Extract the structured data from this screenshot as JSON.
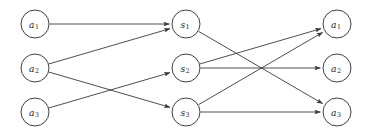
{
  "figure": {
    "background_color": "#ffffff",
    "width": 372,
    "height": 136
  },
  "style": {
    "node_fill": "#ffffff",
    "node_stroke": "#2b2b2b",
    "edge_color": "#3a3a3a",
    "label_color": "#1d1d1d",
    "node_radius": 14
  },
  "chart_data": {
    "type": "diagram",
    "subtype": "directed-tripartite-graph",
    "title": "",
    "columns": [
      {
        "name": "source-layer",
        "x": 35,
        "nodes": [
          {
            "id": "L1",
            "base": "a",
            "subscript": "1",
            "label": "a1",
            "x": 35,
            "y": 24
          },
          {
            "id": "L2",
            "base": "a",
            "subscript": "2",
            "label": "a2",
            "x": 35,
            "y": 68
          },
          {
            "id": "L3",
            "base": "a",
            "subscript": "3",
            "label": "a3",
            "x": 35,
            "y": 112
          }
        ]
      },
      {
        "name": "middle-layer",
        "x": 186,
        "nodes": [
          {
            "id": "M1",
            "base": "s",
            "subscript": "1",
            "label": "s1",
            "x": 186,
            "y": 24
          },
          {
            "id": "M2",
            "base": "s",
            "subscript": "2",
            "label": "s2",
            "x": 186,
            "y": 68
          },
          {
            "id": "M3",
            "base": "s",
            "subscript": "3",
            "label": "s3",
            "x": 186,
            "y": 112
          }
        ]
      },
      {
        "name": "target-layer",
        "x": 337,
        "nodes": [
          {
            "id": "R1",
            "base": "a",
            "subscript": "1",
            "label": "a1",
            "x": 337,
            "y": 24
          },
          {
            "id": "R2",
            "base": "a",
            "subscript": "2",
            "label": "a2",
            "x": 337,
            "y": 68
          },
          {
            "id": "R3",
            "base": "a",
            "subscript": "3",
            "label": "a3",
            "x": 337,
            "y": 112
          }
        ]
      }
    ],
    "edges": [
      {
        "id": "e1",
        "from": "L1",
        "to": "M1",
        "directed": true
      },
      {
        "id": "e2",
        "from": "L2",
        "to": "M1",
        "directed": true
      },
      {
        "id": "e3",
        "from": "L2",
        "to": "M3",
        "directed": true
      },
      {
        "id": "e4",
        "from": "L3",
        "to": "M2",
        "directed": true
      },
      {
        "id": "e5",
        "from": "M1",
        "to": "R3",
        "directed": true
      },
      {
        "id": "e6",
        "from": "M2",
        "to": "R1",
        "directed": true
      },
      {
        "id": "e7",
        "from": "M2",
        "to": "R2",
        "directed": true
      },
      {
        "id": "e8",
        "from": "M3",
        "to": "R1",
        "directed": true
      },
      {
        "id": "e9",
        "from": "M3",
        "to": "R3",
        "directed": true
      }
    ]
  }
}
